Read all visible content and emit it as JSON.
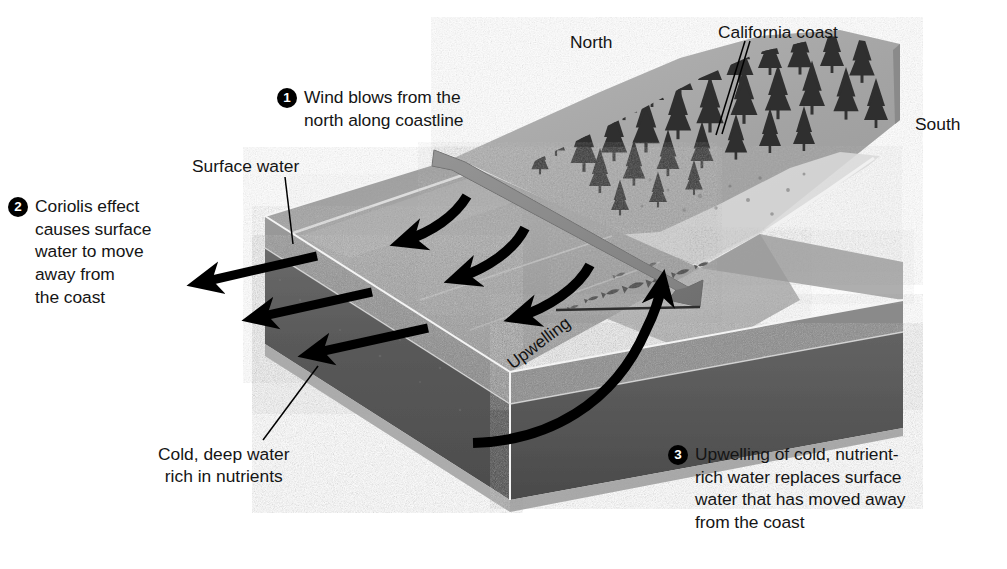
{
  "figure": {
    "type": "labeled-3d-block-diagram"
  },
  "steps": [
    {
      "number": "1",
      "text": "Wind blows from the\nnorth along coastline"
    },
    {
      "number": "2",
      "text": "Coriolis effect\ncauses surface\nwater to move\naway from\nthe coast"
    },
    {
      "number": "3",
      "text": "Upwelling of cold, nutrient-\nrich water replaces surface\nwater that has moved away\nfrom the coast"
    }
  ],
  "labels": {
    "surface_water": "Surface water",
    "cold_deep_water": "Cold, deep water\nrich in nutrients",
    "north": "North",
    "south": "South",
    "california_coast": "California coast",
    "upwelling": "Upwelling"
  },
  "colors": {
    "background": "#ffffff",
    "text": "#151515",
    "bullet_fill": "#000000",
    "bullet_text": "#ffffff",
    "ocean_surface": "#9d9d9d",
    "ocean_surface_light": "#b4b4b4",
    "surface_water_layer": "#8e8e8e",
    "deep_water_face": "#565656",
    "deep_water_face_dark": "#4a4a4a",
    "bottom_bevel": "#a2a2a2",
    "seafloor": "#9a9a9a",
    "land": "#a8a8a8",
    "beach": "#d8d8d8",
    "forest": "#3a3a3a",
    "arrow": "#000000",
    "wind_arrow": "#7d7d7d",
    "leader_line": "#000000"
  }
}
